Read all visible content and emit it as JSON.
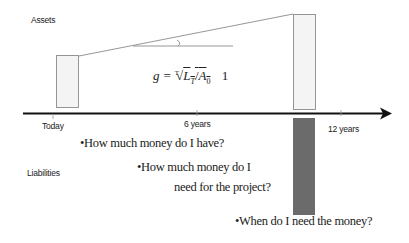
{
  "labels": {
    "assets": "Assets",
    "liabilities": "Liabilities"
  },
  "timeline": {
    "ticks": [
      {
        "label": "Today",
        "x": 53
      },
      {
        "label": "6 years",
        "x": 197
      },
      {
        "label": "12 years",
        "x": 341
      }
    ]
  },
  "formula": {
    "lhs": "g =",
    "root_index": "T",
    "numerator": "L",
    "numerator_sub": "T",
    "slash": "/",
    "denominator": "A",
    "denominator_sub": "0",
    "tail": "1"
  },
  "questions": [
    {
      "line1": "•How much money do I have?"
    },
    {
      "line1": "•How much money do I",
      "line2": "need for the project?"
    },
    {
      "line1": "•When do I need the money?"
    }
  ],
  "colors": {
    "box_stroke": "#8a8a8a",
    "box_fill": "#f4f4f4",
    "liability_fill": "#6b6b6b",
    "axis": "#111111"
  }
}
